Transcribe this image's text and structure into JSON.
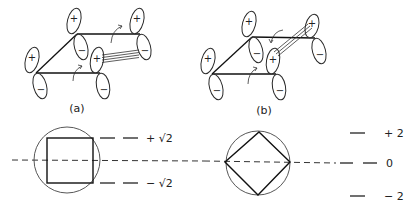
{
  "panels": [
    {
      "id": "a",
      "label": "(a)",
      "orbitals": [
        {
          "node": "bottom-left",
          "upper_sign": "+",
          "lower_sign": "−"
        },
        {
          "node": "top-left",
          "upper_sign": "+",
          "lower_sign": "−"
        },
        {
          "node": "top-right",
          "upper_sign": "+",
          "lower_sign": "−"
        },
        {
          "node": "bottom-right",
          "upper_sign": "+",
          "lower_sign": "−"
        }
      ],
      "overlap": "top-right lower lobe to bottom-right upper lobe (phase-mismatched, Möbius-type twist)",
      "energy_levels": [
        {
          "label": "+ √2",
          "degeneracy": 2
        },
        {
          "label": "− √2",
          "degeneracy": 2
        }
      ],
      "frost_polygon": "square"
    },
    {
      "id": "b",
      "label": "(b)",
      "orbitals": [
        {
          "node": "bottom-left",
          "upper_sign": "+",
          "lower_sign": "−"
        },
        {
          "node": "top-left",
          "upper_sign": "+",
          "lower_sign": "−"
        },
        {
          "node": "top-right",
          "upper_sign": "+",
          "lower_sign": "−"
        },
        {
          "node": "bottom-right",
          "upper_sign": "+",
          "lower_sign": "−"
        }
      ],
      "overlap": "top-right upper lobe to bottom-right upper lobe (Hückel-type)",
      "energy_levels": [
        {
          "label": "+ 2",
          "degeneracy": 1
        },
        {
          "label": "0",
          "degeneracy": 2
        },
        {
          "label": "− 2",
          "degeneracy": 1
        }
      ],
      "frost_polygon": "diamond"
    }
  ],
  "sign_plus": "+",
  "sign_minus": "−"
}
